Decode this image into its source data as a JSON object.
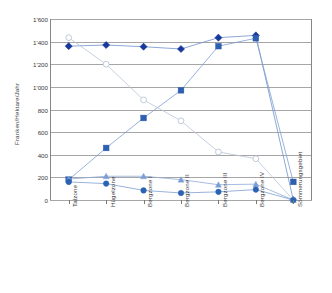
{
  "chart_data": {
    "type": "line",
    "title": "",
    "xlabel": "",
    "ylabel": "Franken/Hektare/Jahr",
    "ylim": [
      0,
      1600
    ],
    "ytick_values": [
      0,
      200,
      400,
      600,
      800,
      1000,
      1200,
      1400,
      1600
    ],
    "ytick_labels": [
      "0",
      "200",
      "400",
      "600",
      "800",
      "1'000",
      "1'200",
      "1'400",
      "1'600"
    ],
    "grid": true,
    "legend_position": "none",
    "categories": [
      "Talzone",
      "Hügelzone",
      "Bergzone I",
      "Bergzone II",
      "Bergzone III",
      "Bergzone IV",
      "Sömmerungsgebiet"
    ],
    "series": [
      {
        "name": "series-diamond",
        "marker": "diamond",
        "marker_color": "#17399c",
        "line_color": "#6f92cc",
        "values": [
          1360,
          1370,
          1355,
          1335,
          1435,
          1455,
          0
        ]
      },
      {
        "name": "series-square",
        "marker": "square",
        "marker_color": "#2f5fb0",
        "line_color": "#7f9ed1",
        "values": [
          180,
          460,
          725,
          970,
          1360,
          1430,
          160
        ]
      },
      {
        "name": "series-open-circle",
        "marker": "open-circle",
        "marker_color": "#ffffff",
        "line_color": "#b9c4d6",
        "values": [
          1435,
          1200,
          885,
          700,
          425,
          365,
          0
        ]
      },
      {
        "name": "series-triangle",
        "marker": "triangle",
        "marker_color": "#7c9ed6",
        "line_color": "#8fabd9",
        "values": [
          185,
          210,
          210,
          180,
          135,
          140,
          0
        ]
      },
      {
        "name": "series-filled-circle",
        "marker": "circle",
        "marker_color": "#2a62b4",
        "line_color": "#7f9ed1",
        "values": [
          160,
          145,
          85,
          62,
          72,
          92,
          0
        ]
      }
    ],
    "colors": {
      "gridline": "#a6a6a6",
      "axis": "#868686",
      "text": "#3a3a3a",
      "background": "#ffffff"
    }
  }
}
